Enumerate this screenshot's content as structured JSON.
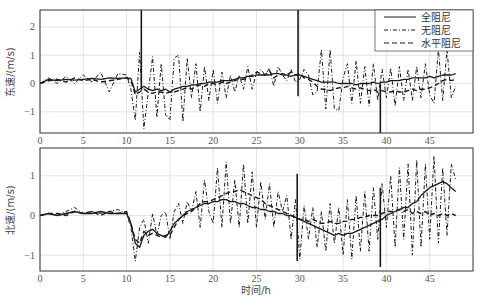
{
  "chart_data": [
    {
      "type": "line",
      "title": "",
      "xlabel": "",
      "ylabel": "东速/(m/s)",
      "xlim": [
        0,
        50
      ],
      "ylim": [
        -1.75,
        2.6
      ],
      "xticks": [
        0,
        5,
        10,
        15,
        20,
        25,
        30,
        35,
        40,
        45
      ],
      "yticks": [
        -1,
        0,
        1,
        2
      ],
      "grid": true,
      "legend": {
        "position": "upper right",
        "entries": [
          "全阻尼",
          "无阻尼",
          "水平阻尼"
        ]
      },
      "x": [
        0,
        1,
        2,
        3,
        4,
        5,
        6,
        7,
        8,
        9,
        10,
        10.5,
        11,
        11.5,
        12,
        12.5,
        13,
        13.5,
        14,
        14.5,
        15,
        15.5,
        16,
        16.5,
        17,
        17.5,
        18,
        18.5,
        19,
        19.5,
        20,
        20.5,
        21,
        21.5,
        22,
        22.5,
        23,
        23.5,
        24,
        24.5,
        25,
        25.5,
        26,
        26.5,
        27,
        27.5,
        28,
        28.5,
        29,
        29.5,
        30,
        30.5,
        31,
        31.5,
        32,
        32.5,
        33,
        33.5,
        34,
        34.5,
        35,
        35.5,
        36,
        36.5,
        37,
        37.5,
        38,
        38.5,
        39,
        39.5,
        40,
        40.5,
        41,
        41.5,
        42,
        42.5,
        43,
        43.5,
        44,
        44.5,
        45,
        45.5,
        46,
        46.5,
        47,
        47.5,
        48
      ],
      "series": [
        {
          "name": "全阻尼",
          "style": "solid",
          "values": [
            0,
            0.15,
            0.1,
            0.15,
            0.12,
            0.15,
            0.18,
            0.15,
            0.2,
            0.18,
            0.2,
            0.18,
            -0.3,
            -0.2,
            -0.1,
            -0.2,
            -0.25,
            -0.2,
            -0.25,
            -0.2,
            -0.3,
            -0.2,
            -0.15,
            -0.1,
            -0.1,
            -0.05,
            -0.05,
            0,
            0,
            0.05,
            0.05,
            0.05,
            0.1,
            0.1,
            0.1,
            0.15,
            0.2,
            0.2,
            0.25,
            0.25,
            0.3,
            0.3,
            0.3,
            0.3,
            0.35,
            0.35,
            0.3,
            0.3,
            0.25,
            0.3,
            0.3,
            0.25,
            0.2,
            0.15,
            0.1,
            0.05,
            0.05,
            0.05,
            0.05,
            0,
            0,
            0,
            0,
            -0.05,
            0,
            0,
            0,
            0.05,
            0,
            0.05,
            0.05,
            0.1,
            0.1,
            0.1,
            0.15,
            0.15,
            0.2,
            0.2,
            0.2,
            0.2,
            0.25,
            0.2,
            0.25,
            0.3,
            0.3,
            0.3,
            0.35
          ]
        },
        {
          "name": "无阻尼",
          "style": "dashdot",
          "values": [
            0,
            0.2,
            0.0,
            0.25,
            0.0,
            0.3,
            0.05,
            0.4,
            -0.3,
            0.35,
            0.3,
            -0.2,
            -1.3,
            1.1,
            -1.6,
            -0.3,
            0.95,
            -1.2,
            0.7,
            -1.1,
            -1.3,
            0.9,
            1.0,
            -1.35,
            0.9,
            -0.5,
            0.7,
            -1.0,
            0.6,
            -0.6,
            0.5,
            -0.7,
            0.4,
            -0.5,
            0.3,
            -0.3,
            0.3,
            -0.2,
            0.6,
            -0.2,
            0.4,
            0.5,
            0.3,
            0.55,
            -0.1,
            0.6,
            0.3,
            0.1,
            0.5,
            0.05,
            0.15,
            0.5,
            0.3,
            -0.4,
            -0.3,
            1.2,
            -0.9,
            1.2,
            -0.9,
            -0.95,
            0.2,
            0.7,
            -0.7,
            0.8,
            -0.7,
            0.6,
            -0.8,
            0.7,
            -0.6,
            0.5,
            -0.5,
            0.55,
            -0.8,
            0.6,
            -0.6,
            0.5,
            -0.6,
            0.6,
            -0.5,
            0.7,
            -0.4,
            -0.7,
            1.2,
            -0.6,
            1.2,
            -0.5,
            -0.1
          ]
        },
        {
          "name": "水平阻尼",
          "style": "dashed",
          "values": [
            0,
            0.1,
            0.15,
            0.05,
            0.2,
            0.1,
            0.15,
            0.05,
            0.1,
            0.15,
            0.2,
            0.1,
            -0.4,
            -0.3,
            -0.2,
            -0.3,
            -0.35,
            -0.3,
            -0.3,
            -0.35,
            -0.3,
            -0.3,
            -0.25,
            -0.2,
            -0.15,
            -0.2,
            -0.1,
            -0.05,
            -0.1,
            0,
            0,
            -0.05,
            0.05,
            0,
            0.05,
            0.1,
            0.15,
            0.15,
            0.2,
            0.3,
            0.4,
            0.35,
            0.3,
            0.45,
            0.2,
            0.3,
            0.35,
            0.3,
            0.4,
            0.3,
            0.35,
            0.2,
            0.15,
            0.05,
            -0.1,
            -0.2,
            -0.2,
            -0.25,
            -0.2,
            -0.15,
            -0.15,
            -0.1,
            -0.15,
            -0.2,
            -0.15,
            -0.2,
            -0.25,
            -0.2,
            -0.3,
            -0.25,
            -0.3,
            -0.3,
            -0.25,
            -0.3,
            -0.3,
            -0.25,
            -0.2,
            -0.25,
            -0.2,
            -0.2,
            -0.15,
            -0.1,
            0,
            0.1,
            0.15,
            0.1,
            0.15
          ]
        }
      ],
      "annotations": [
        {
          "type": "spike",
          "x": 11.7,
          "y_min": -0.2,
          "y_max": 2.6
        },
        {
          "type": "spike",
          "x": 29.8,
          "y_min": -0.45,
          "y_max": 2.6
        },
        {
          "type": "spike",
          "x": 39.3,
          "y_min": -1.75,
          "y_max": 0.0
        }
      ]
    },
    {
      "type": "line",
      "title": "",
      "xlabel": "时间/h",
      "ylabel": "北速/(m/s)",
      "xlim": [
        0,
        50
      ],
      "ylim": [
        -1.4,
        1.7
      ],
      "xticks": [
        0,
        5,
        10,
        15,
        20,
        25,
        30,
        35,
        40,
        45
      ],
      "yticks": [
        -1,
        0,
        1
      ],
      "grid": true,
      "x": [
        0,
        1,
        2,
        3,
        4,
        5,
        6,
        7,
        8,
        9,
        10,
        10.5,
        11,
        11.5,
        12,
        12.5,
        13,
        13.5,
        14,
        14.5,
        15,
        15.5,
        16,
        16.5,
        17,
        17.5,
        18,
        18.5,
        19,
        19.5,
        20,
        20.5,
        21,
        21.5,
        22,
        22.5,
        23,
        23.5,
        24,
        24.5,
        25,
        25.5,
        26,
        26.5,
        27,
        27.5,
        28,
        28.5,
        29,
        29.5,
        30,
        30.5,
        31,
        31.5,
        32,
        32.5,
        33,
        33.5,
        34,
        34.5,
        35,
        35.5,
        36,
        36.5,
        37,
        37.5,
        38,
        38.5,
        39,
        39.5,
        40,
        40.5,
        41,
        41.5,
        42,
        42.5,
        43,
        43.5,
        44,
        44.5,
        45,
        45.5,
        46,
        46.5,
        47,
        47.5,
        48
      ],
      "series": [
        {
          "name": "全阻尼",
          "style": "solid",
          "values": [
            0,
            0.05,
            0,
            0.05,
            0.1,
            0.05,
            0.05,
            0.1,
            0.05,
            0.05,
            0.05,
            -0.2,
            -0.7,
            -0.8,
            -0.5,
            -0.4,
            -0.35,
            -0.45,
            -0.5,
            -0.55,
            -0.4,
            -0.2,
            -0.1,
            0,
            0.1,
            0.15,
            0.2,
            0.25,
            0.3,
            0.3,
            0.35,
            0.35,
            0.4,
            0.4,
            0.35,
            0.35,
            0.3,
            0.3,
            0.25,
            0.2,
            0.2,
            0.15,
            0.15,
            0.1,
            0.1,
            0.05,
            0.05,
            0,
            0,
            -0.05,
            -0.1,
            -0.15,
            -0.2,
            -0.25,
            -0.3,
            -0.35,
            -0.4,
            -0.45,
            -0.5,
            -0.45,
            -0.5,
            -0.45,
            -0.45,
            -0.4,
            -0.35,
            -0.3,
            -0.25,
            -0.2,
            -0.15,
            -0.1,
            0,
            0.05,
            0.1,
            0.15,
            0.2,
            0.2,
            0.3,
            0.35,
            0.5,
            0.6,
            0.7,
            0.75,
            0.8,
            0.85,
            0.8,
            0.7,
            0.6
          ]
        },
        {
          "name": "无阻尼",
          "style": "dashdot",
          "values": [
            0,
            0.05,
            0,
            0.1,
            0.2,
            0.05,
            0.1,
            0.05,
            0.1,
            0.15,
            0.05,
            -0.3,
            -1.15,
            -0.3,
            -0.1,
            -0.7,
            0.05,
            -0.5,
            0,
            0.1,
            -0.6,
            0.1,
            0.3,
            -0.2,
            0.35,
            0.1,
            0.6,
            -0.3,
            0.9,
            0.1,
            -0.2,
            1.2,
            -0.3,
            1.35,
            -0.2,
            0.9,
            -0.3,
            1.3,
            -0.2,
            1.1,
            -0.3,
            0.85,
            -0.1,
            0.8,
            -0.3,
            0.6,
            0.1,
            0.5,
            -0.6,
            0.4,
            -1.1,
            0.25,
            -0.6,
            0.2,
            -0.8,
            0.1,
            -0.9,
            0.3,
            -0.7,
            0.2,
            -1.0,
            0.4,
            -1.1,
            0.5,
            -0.9,
            0.6,
            -0.9,
            0.7,
            -0.6,
            0.8,
            -0.3,
            1.0,
            -0.8,
            1.2,
            -0.6,
            1.3,
            -1.0,
            1.4,
            -0.8,
            1.3,
            -0.6,
            1.5,
            -0.7,
            1.2,
            -0.5,
            1.3,
            0.9
          ]
        },
        {
          "name": "水平阻尼",
          "style": "dashed",
          "values": [
            0,
            0.05,
            0.05,
            0,
            0.1,
            0.05,
            0.1,
            0,
            0.1,
            0.05,
            0.1,
            -0.2,
            -0.6,
            -0.7,
            -0.4,
            -0.5,
            -0.45,
            -0.5,
            -0.55,
            -0.5,
            -0.5,
            -0.3,
            -0.1,
            0,
            0.05,
            0.1,
            0.2,
            0.3,
            0.35,
            0.35,
            0.4,
            0.45,
            0.5,
            0.55,
            0.6,
            0.6,
            0.65,
            0.6,
            0.55,
            0.5,
            0.45,
            0.4,
            0.3,
            0.25,
            0.2,
            0.15,
            0.1,
            0.05,
            0,
            -0.05,
            -0.1,
            -0.1,
            -0.15,
            -0.1,
            -0.15,
            -0.2,
            -0.2,
            -0.15,
            -0.2,
            -0.2,
            -0.15,
            -0.15,
            -0.1,
            -0.1,
            -0.05,
            -0.05,
            0,
            0,
            0,
            0.05,
            0.1,
            0.1,
            0.1,
            0.15,
            0.1,
            0.15,
            0.05,
            0.1,
            0.05,
            0.1,
            0,
            0.05,
            0,
            0.05,
            0,
            0.05,
            0
          ]
        }
      ],
      "annotations": [
        {
          "type": "spike",
          "x": 29.7,
          "y_min": -1.15,
          "y_max": 1.05
        },
        {
          "type": "spike",
          "x": 39.3,
          "y_min": -1.3,
          "y_max": 0.7
        }
      ]
    }
  ],
  "axes": {
    "top": {
      "ylabel": "东速/(m/s)"
    },
    "bottom": {
      "ylabel": "北速/(m/s)",
      "xlabel": "时间/h"
    }
  },
  "legend": {
    "entries": [
      {
        "label": "全阻尼",
        "style": "solid"
      },
      {
        "label": "无阻尼",
        "style": "dashdot"
      },
      {
        "label": "水平阻尼",
        "style": "dashed"
      }
    ]
  },
  "colors": {
    "line": "#1a1a1a",
    "grid": "#d0d0d0",
    "axis": "#333333",
    "text": "#555555"
  }
}
